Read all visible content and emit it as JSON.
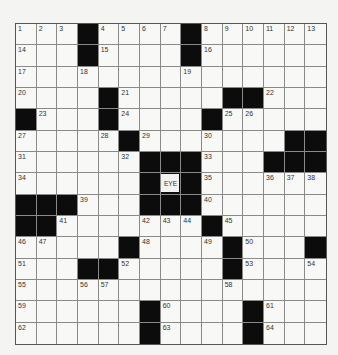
{
  "puzzle": {
    "rows": 15,
    "cols": 15,
    "center_label": "EYE",
    "center_cell": [
      7,
      7
    ],
    "colors": {
      "black": "#0c0c0c",
      "white": "#f8f8f6",
      "line": "#8a8a8a"
    },
    "layout": [
      "...#....#......",
      "...#....#......",
      "...............",
      "....#.....##...",
      "#...#....#.....",
      ".....#.......##",
      "......###...###",
      "......#E#......",
      "###...###......",
      "##.......#.....",
      ".....#....#...#",
      "...##.....#....",
      "...............",
      "......#....#...",
      "......#....#..."
    ],
    "numbers": [
      {
        "r": 0,
        "c": 0,
        "n": "1"
      },
      {
        "r": 0,
        "c": 1,
        "n": "2"
      },
      {
        "r": 0,
        "c": 2,
        "n": "3"
      },
      {
        "r": 0,
        "c": 4,
        "n": "4"
      },
      {
        "r": 0,
        "c": 5,
        "n": "5"
      },
      {
        "r": 0,
        "c": 6,
        "n": "6"
      },
      {
        "r": 0,
        "c": 7,
        "n": "7"
      },
      {
        "r": 0,
        "c": 9,
        "n": "8"
      },
      {
        "r": 0,
        "c": 10,
        "n": "9"
      },
      {
        "r": 0,
        "c": 11,
        "n": "10"
      },
      {
        "r": 0,
        "c": 12,
        "n": "11"
      },
      {
        "r": 0,
        "c": 13,
        "n": "12"
      },
      {
        "r": 0,
        "c": 14,
        "n": "13"
      },
      {
        "r": 1,
        "c": 0,
        "n": "14"
      },
      {
        "r": 1,
        "c": 4,
        "n": "15"
      },
      {
        "r": 1,
        "c": 9,
        "n": "16"
      },
      {
        "r": 2,
        "c": 0,
        "n": "17"
      },
      {
        "r": 2,
        "c": 3,
        "n": "18"
      },
      {
        "r": 2,
        "c": 8,
        "n": "19"
      },
      {
        "r": 3,
        "c": 0,
        "n": "20"
      },
      {
        "r": 3,
        "c": 5,
        "n": "21"
      },
      {
        "r": 3,
        "c": 12,
        "n": "22"
      },
      {
        "r": 4,
        "c": 1,
        "n": "23"
      },
      {
        "r": 4,
        "c": 5,
        "n": "24"
      },
      {
        "r": 4,
        "c": 10,
        "n": "25"
      },
      {
        "r": 4,
        "c": 11,
        "n": "26"
      },
      {
        "r": 5,
        "c": 0,
        "n": "27"
      },
      {
        "r": 5,
        "c": 4,
        "n": "28"
      },
      {
        "r": 5,
        "c": 6,
        "n": "29"
      },
      {
        "r": 5,
        "c": 9,
        "n": "30"
      },
      {
        "r": 6,
        "c": 0,
        "n": "31"
      },
      {
        "r": 6,
        "c": 5,
        "n": "32"
      },
      {
        "r": 6,
        "c": 9,
        "n": "33"
      },
      {
        "r": 7,
        "c": 0,
        "n": "34"
      },
      {
        "r": 7,
        "c": 9,
        "n": "35"
      },
      {
        "r": 7,
        "c": 12,
        "n": "36"
      },
      {
        "r": 7,
        "c": 13,
        "n": "37"
      },
      {
        "r": 7,
        "c": 14,
        "n": "38"
      },
      {
        "r": 8,
        "c": 3,
        "n": "39"
      },
      {
        "r": 8,
        "c": 9,
        "n": "40"
      },
      {
        "r": 9,
        "c": 2,
        "n": "41"
      },
      {
        "r": 9,
        "c": 6,
        "n": "42"
      },
      {
        "r": 9,
        "c": 7,
        "n": "43"
      },
      {
        "r": 9,
        "c": 8,
        "n": "44"
      },
      {
        "r": 9,
        "c": 10,
        "n": "45"
      },
      {
        "r": 10,
        "c": 0,
        "n": "46"
      },
      {
        "r": 10,
        "c": 1,
        "n": "47"
      },
      {
        "r": 10,
        "c": 6,
        "n": "48"
      },
      {
        "r": 10,
        "c": 9,
        "n": "49"
      },
      {
        "r": 10,
        "c": 11,
        "n": "50"
      },
      {
        "r": 11,
        "c": 0,
        "n": "51"
      },
      {
        "r": 11,
        "c": 5,
        "n": "52"
      },
      {
        "r": 11,
        "c": 11,
        "n": "53"
      },
      {
        "r": 11,
        "c": 14,
        "n": "54"
      },
      {
        "r": 12,
        "c": 0,
        "n": "55"
      },
      {
        "r": 12,
        "c": 3,
        "n": "56"
      },
      {
        "r": 12,
        "c": 4,
        "n": "57"
      },
      {
        "r": 12,
        "c": 10,
        "n": "58"
      },
      {
        "r": 13,
        "c": 0,
        "n": "59"
      },
      {
        "r": 13,
        "c": 7,
        "n": "60"
      },
      {
        "r": 13,
        "c": 12,
        "n": "61"
      },
      {
        "r": 14,
        "c": 0,
        "n": "62"
      },
      {
        "r": 14,
        "c": 7,
        "n": "63"
      },
      {
        "r": 14,
        "c": 12,
        "n": "64"
      }
    ]
  }
}
